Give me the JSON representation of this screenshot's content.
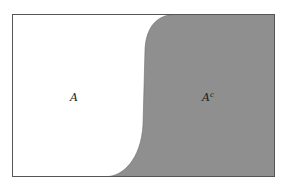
{
  "diagram": {
    "type": "venn-complement",
    "universe": {
      "x": 12,
      "y": 14,
      "width": 262,
      "height": 162,
      "stroke": "#555555",
      "fill": "#ffffff"
    },
    "complement_fill": "#8f8f8f",
    "labels": {
      "set": "A",
      "complement_base": "A",
      "complement_sup": "c"
    }
  }
}
